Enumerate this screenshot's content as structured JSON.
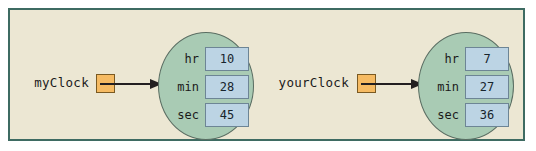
{
  "diagram": {
    "frame": {
      "background_color": "#ece7d3",
      "border_color": "#3e6b62"
    },
    "colors": {
      "pointer_cell": "#f6bb63",
      "pointer_cell_border": "#7a5a22",
      "object_circle": "#a9cbb4",
      "object_circle_border": "#5a6d62",
      "field_value_box": "#bcd4e4",
      "field_value_border": "#6d8595",
      "arrow": "#231f20"
    },
    "objects": [
      {
        "variable_label": "myClock",
        "pointer_icon": "pointer-cell-icon",
        "arrow_icon": "arrow-right-icon",
        "fields": [
          {
            "name": "hr",
            "value": "10"
          },
          {
            "name": "min",
            "value": "28"
          },
          {
            "name": "sec",
            "value": "45"
          }
        ]
      },
      {
        "variable_label": "yourClock",
        "pointer_icon": "pointer-cell-icon",
        "arrow_icon": "arrow-right-icon",
        "fields": [
          {
            "name": "hr",
            "value": "7"
          },
          {
            "name": "min",
            "value": "27"
          },
          {
            "name": "sec",
            "value": "36"
          }
        ]
      }
    ]
  }
}
